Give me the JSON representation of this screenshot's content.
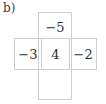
{
  "figure": {
    "label": "b)",
    "type": "cross-shaped-number-grid",
    "line_color": "#cfcfcf",
    "text_color": "#2e2e2e",
    "cells": {
      "top": "−5",
      "left": "−3",
      "center": "4",
      "right": "−2",
      "bottom": ""
    }
  }
}
